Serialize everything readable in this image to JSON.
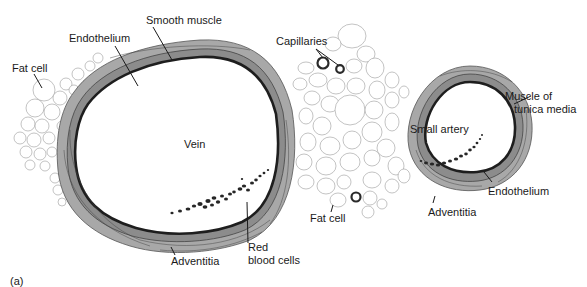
{
  "figure": {
    "panel_label": "(a)",
    "labels": {
      "smooth_muscle": "Smooth muscle",
      "endothelium_vein": "Endothelium",
      "fat_cell_left": "Fat cell",
      "capillaries": "Capillaries",
      "vein": "Vein",
      "small_artery": "Small artery",
      "muscle_of_tunica_media_line1": "Muscle of",
      "muscle_of_tunica_media_line2": "tunica media",
      "endothelium_artery": "Endothelium",
      "adventitia_artery": "Adventitia",
      "fat_cell_center": "Fat cell",
      "red_blood_cells_line1": "Red",
      "red_blood_cells_line2": "blood cells",
      "adventitia_vein": "Adventitia"
    },
    "colors": {
      "adventitia": "#a8a8a8",
      "tunica_media": "#8c8c8c",
      "endothelium": "#1e1e1e",
      "fat_cell_outline": "#9a9a9a",
      "red_blood_cells": "#262626",
      "text": "#1a1a1a"
    }
  }
}
